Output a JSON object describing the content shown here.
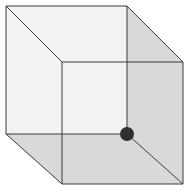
{
  "diagram": {
    "type": "necker-cube",
    "colors": {
      "background": "#ffffff",
      "light_face": "#f3f3f3",
      "shaded_face": "#d9d9d9",
      "edge": "#3a3a3a",
      "dot": "#2f2f2f"
    },
    "vertices": {
      "back_top_left": [
        6,
        6
      ],
      "back_top_right": [
        127,
        6
      ],
      "back_bottom_left": [
        6,
        134
      ],
      "back_bottom_right": [
        127,
        134
      ],
      "front_top_left": [
        62,
        62
      ],
      "front_top_right": [
        183,
        62
      ],
      "front_bottom_left": [
        62,
        184
      ],
      "front_bottom_right": [
        183,
        184
      ]
    },
    "dot": {
      "at": "back_bottom_right",
      "radius": 7
    }
  }
}
